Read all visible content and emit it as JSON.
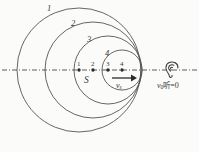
{
  "figure": {
    "background_color": "#fbfbfa",
    "stroke_color": "#555555",
    "axis": {
      "style": "dash-dot",
      "y": 70,
      "x_start": 2,
      "x_end": 197
    },
    "wavefronts": [
      {
        "label": "1",
        "cx": 79,
        "cy": 70,
        "r": 62,
        "label_x": 47,
        "label_y": 4
      },
      {
        "label": "2",
        "cx": 93,
        "cy": 70,
        "r": 48,
        "label_x": 71,
        "label_y": 19
      },
      {
        "label": "3",
        "cx": 108,
        "cy": 70,
        "r": 34,
        "label_x": 87,
        "label_y": 35
      },
      {
        "label": "4",
        "cx": 122,
        "cy": 70,
        "r": 20,
        "label_x": 105,
        "label_y": 49
      }
    ],
    "source_positions": [
      {
        "label": "1",
        "x": 79,
        "y": 70
      },
      {
        "label": "2",
        "x": 93,
        "y": 70
      },
      {
        "label": "3",
        "x": 108,
        "y": 70
      },
      {
        "label": "4",
        "x": 122,
        "y": 70
      }
    ],
    "source_label": {
      "text": "S",
      "x": 84,
      "y": 76
    },
    "velocity_arrow": {
      "label": "v",
      "subscript": "s",
      "x_start": 112,
      "x_end": 134,
      "y": 78,
      "label_x": 116,
      "label_y": 82
    },
    "observer": {
      "icon_name": "ear-icon",
      "x": 164,
      "y": 60,
      "annotation_prefix": "v",
      "annotation_subscript": "0",
      "annotation_cjk": "听",
      "annotation_suffix": "=0",
      "annotation_x": 157,
      "annotation_y": 82
    }
  }
}
